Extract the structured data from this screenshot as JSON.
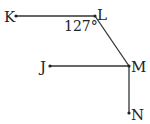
{
  "diagram": {
    "points": {
      "K": {
        "label": "K",
        "x": 16,
        "y": 16
      },
      "L": {
        "label": "L",
        "x": 95,
        "y": 16
      },
      "J": {
        "label": "J",
        "x": 50,
        "y": 66
      },
      "M": {
        "label": "M",
        "x": 129,
        "y": 66
      },
      "N": {
        "label": "N",
        "x": 129,
        "y": 113
      }
    },
    "segments": [
      [
        "K",
        "L"
      ],
      [
        "L",
        "M"
      ],
      [
        "J",
        "M"
      ],
      [
        "M",
        "N"
      ]
    ],
    "angle_label": "127°",
    "colors": {
      "line": "#333333",
      "text": "#222222"
    }
  }
}
